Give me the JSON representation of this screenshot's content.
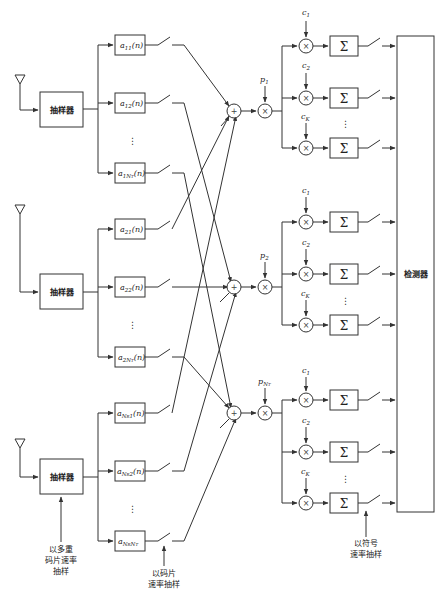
{
  "diagram": {
    "type": "block-diagram",
    "colors": {
      "line": "#333333",
      "background": "#ffffff"
    },
    "samplers": [
      {
        "label": "抽样器"
      },
      {
        "label": "抽样器"
      },
      {
        "label": "抽样器"
      }
    ],
    "filters": [
      {
        "base": "a",
        "sub": "11",
        "arg": "(n)"
      },
      {
        "base": "a",
        "sub": "12",
        "arg": "(n)"
      },
      {
        "base": "a",
        "sub": "1N",
        "subsub": "T",
        "arg": "(n)"
      },
      {
        "base": "a",
        "sub": "21",
        "arg": "(n)"
      },
      {
        "base": "a",
        "sub": "22",
        "arg": "(n)"
      },
      {
        "base": "a",
        "sub": "2N",
        "subsub": "T",
        "arg": "(n)"
      },
      {
        "base": "a",
        "sub": "N",
        "subsub": "R",
        "sub2": "1",
        "arg": "(n)"
      },
      {
        "base": "a",
        "sub": "N",
        "subsub": "R",
        "sub2": "2",
        "arg": "(n)"
      },
      {
        "base": "a",
        "sub": "N",
        "subsub": "R",
        "sub2": "N",
        "subsub2": "T",
        "arg": ""
      }
    ],
    "combiner_symbol": "+",
    "multiplier_symbol": "×",
    "summation_symbol": "Σ",
    "p_labels": [
      {
        "base": "p",
        "sub": "1"
      },
      {
        "base": "p",
        "sub": "2"
      },
      {
        "base": "p",
        "sub": "N",
        "subsub": "T"
      }
    ],
    "c_labels": [
      {
        "base": "c",
        "sub": "1"
      },
      {
        "base": "c",
        "sub": "2"
      },
      {
        "base": "c",
        "sub": "K"
      }
    ],
    "vertical_ellipsis": "⋮",
    "detector": {
      "label": "检测器"
    },
    "annotations": {
      "multi_chip_rate": [
        "以多重",
        "码片速率",
        "抽样"
      ],
      "chip_rate": [
        "以码片",
        "速率抽样"
      ],
      "symbol_rate": [
        "以符号",
        "速率抽样"
      ]
    }
  }
}
